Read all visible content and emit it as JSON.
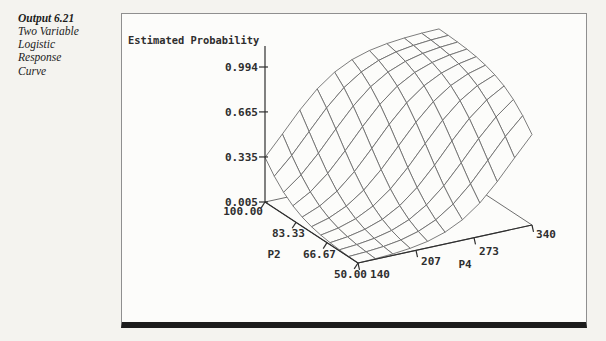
{
  "sidebar": {
    "output_label": "Output 6.21",
    "caption_lines": [
      "Two Variable",
      "Logistic",
      "Response",
      "Curve"
    ]
  },
  "chart_data": {
    "type": "surface",
    "title": "Estimated Probability",
    "z_axis": {
      "label": "Estimated Probability",
      "tick_labels": [
        "0.005",
        "0.335",
        "0.665",
        "0.994"
      ],
      "tick_values": [
        0.005,
        0.335,
        0.665,
        0.994
      ],
      "range": [
        0.005,
        0.994
      ]
    },
    "p2_axis": {
      "label": "P2",
      "tick_labels": [
        "100.00",
        "83.33",
        "66.67",
        "50.00"
      ],
      "tick_values": [
        100,
        83.33,
        66.67,
        50
      ],
      "range": [
        50,
        100
      ]
    },
    "p4_axis": {
      "label": "P4",
      "tick_labels": [
        "140",
        "207",
        "273",
        "340"
      ],
      "tick_values": [
        140,
        207,
        273,
        340
      ],
      "range": [
        140,
        340
      ]
    },
    "surface": {
      "model": "logistic",
      "equation": "p = 1/(1+exp(-(-14.1 + 0.092*P2 + 0.030*P4)))",
      "intercept": -14.1,
      "coef_p2": 0.092,
      "coef_p4": 0.03,
      "grid_lines_p2": 11,
      "grid_lines_p4": 11,
      "corner_probabilities": {
        "P2=50,P4=140": 0.005,
        "P2=100,P4=140": 0.335,
        "P2=50,P4=340": 0.665,
        "P2=100,P4=340": 0.994
      }
    },
    "colors": {
      "mesh": "#6e6e6e",
      "axis": "#2e2e2e",
      "labels": "#2e2e2e",
      "background": "#fcfcfa"
    }
  }
}
